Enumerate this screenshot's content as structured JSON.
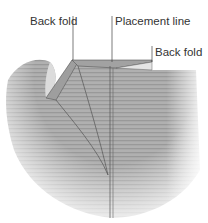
{
  "diagram": {
    "labels": {
      "back_fold_left": "Back fold",
      "placement_line": "Placement line",
      "back_fold_right": "Back fold"
    },
    "colors": {
      "fabric": "#a9a9a9",
      "fabric_light": "#c4c4c4",
      "fold_face": "#9a9a9a",
      "stroke": "#555555",
      "leader": "#444444",
      "text": "#333333",
      "background": "#ffffff"
    }
  }
}
